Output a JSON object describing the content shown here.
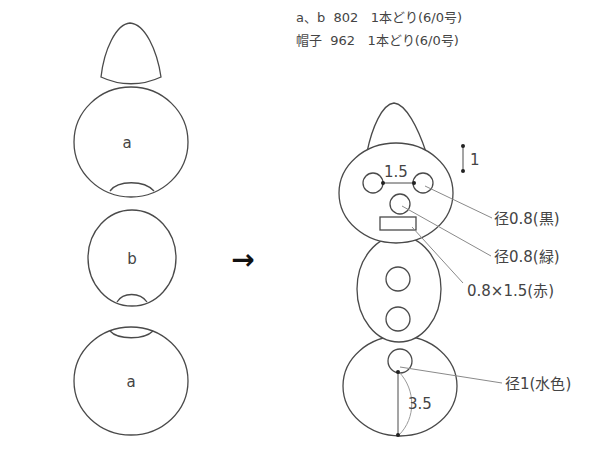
{
  "legend": {
    "rows": [
      {
        "parts": "a、b",
        "color_no": "802",
        "strand": "1本どり",
        "hook": "(6/0号)"
      },
      {
        "parts": "帽子",
        "color_no": "962",
        "strand": "1本どり",
        "hook": "(6/0号)"
      }
    ]
  },
  "pieces": {
    "top_ball_label": "a",
    "middle_ball_label": "b",
    "bottom_ball_label": "a"
  },
  "arrow": "→",
  "assembled": {
    "eye_spacing": "1.5",
    "eye_height": "1",
    "bottom_distance": "3.5",
    "callouts": {
      "eyes": "径0.8(黒)",
      "nose": "径0.8(緑)",
      "mouth": "0.8×1.5(赤)",
      "button": "径1(水色)"
    }
  },
  "colors": {
    "stroke": "#4a4a4a",
    "leader": "#8a8a8a",
    "text": "#444444"
  }
}
